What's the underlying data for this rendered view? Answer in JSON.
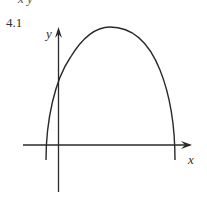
{
  "header": {
    "cut_text": "x  y"
  },
  "problem": {
    "number": "4.1"
  },
  "graph": {
    "x_axis_label": "x",
    "y_axis_label": "y",
    "curve": "downward-opening parabola crossing x-axis left of origin and far right, positive y-intercept"
  }
}
